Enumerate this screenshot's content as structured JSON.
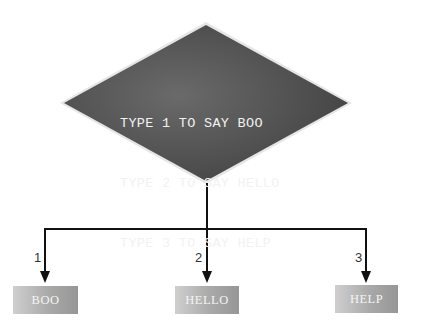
{
  "decision": {
    "lines": [
      "TYPE 1 TO SAY BOO",
      "TYPE 2 TO SAY HELLO",
      "TYPE 3 TO SAY HELP"
    ],
    "fill_color": "#555555",
    "border_color": "#d8d8d8"
  },
  "branches": [
    {
      "label": "1",
      "output": "BOO"
    },
    {
      "label": "2",
      "output": "HELLO"
    },
    {
      "label": "3",
      "output": "HELP"
    }
  ]
}
